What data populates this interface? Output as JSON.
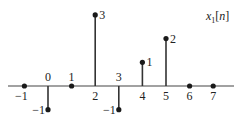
{
  "chart_data": {
    "type": "stem",
    "title": "x1[n]",
    "title_parts": {
      "base": "x",
      "sub": "1",
      "arg": "[n]"
    },
    "xlabel": "",
    "ylabel": "",
    "x": [
      -1,
      0,
      1,
      2,
      3,
      4,
      5,
      6,
      7
    ],
    "values": [
      0,
      -1,
      0,
      3,
      -1,
      1,
      2,
      0,
      0
    ],
    "x_tick_labels": [
      "−1",
      "0",
      "1",
      "2",
      "3",
      "4",
      "5",
      "6",
      "7"
    ],
    "value_labels": {
      "0": "−1",
      "2": "3",
      "3": "−1",
      "4": "1",
      "5": "2"
    },
    "xlim": [
      -1.5,
      8.5
    ],
    "ylim": [
      -1,
      3
    ],
    "grid": false,
    "legend": "none",
    "title_position": "top-right",
    "color": "#222222"
  }
}
